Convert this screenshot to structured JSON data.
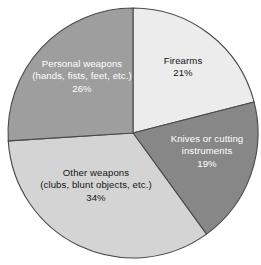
{
  "chart_data": {
    "type": "pie",
    "title": "",
    "subtitle": "",
    "xlabel": "",
    "ylabel": "",
    "legend_position": "none",
    "grid": false,
    "labels_inside_slices": true,
    "start_angle_deg": 0,
    "direction": "clockwise",
    "units": "%",
    "categories": [
      "Firearms",
      "Knives or cutting instruments",
      "Other weapons (clubs, blunt objects, etc.)",
      "Personal weapons (hands, fists, feet, etc.)"
    ],
    "values": [
      21,
      19,
      34,
      26
    ],
    "slices": [
      {
        "id": "firearms",
        "label_lines": [
          "Firearms"
        ],
        "value": 21,
        "value_text": "21%",
        "color": "#ececec",
        "text_color": "#141414",
        "start_deg": 0,
        "end_deg": 75.6
      },
      {
        "id": "knives",
        "label_lines": [
          "Knives or cutting",
          "instruments"
        ],
        "value": 19,
        "value_text": "19%",
        "color": "#878787",
        "text_color": "#ffffff",
        "start_deg": 75.6,
        "end_deg": 144.0
      },
      {
        "id": "other-weapons",
        "label_lines": [
          "Other weapons",
          "(clubs, blunt objects, etc.)"
        ],
        "value": 34,
        "value_text": "34%",
        "color": "#d4d4d4",
        "text_color": "#141414",
        "start_deg": 144.0,
        "end_deg": 266.4
      },
      {
        "id": "personal-weapons",
        "label_lines": [
          "Personal weapons",
          "(hands, fists, feet, etc.)"
        ],
        "value": 26,
        "value_text": "26%",
        "color": "#9e9e9e",
        "text_color": "#ffffff",
        "start_deg": 266.4,
        "end_deg": 360.0
      }
    ],
    "geometry": {
      "center_x": 133,
      "center_y": 133,
      "radius": 125,
      "outline_color": "#4a4a4a"
    },
    "background_color": "#ffffff"
  },
  "labels": {
    "firearms": {
      "line1": "Firearms",
      "value": "21%"
    },
    "knives": {
      "line1": "Knives or cutting",
      "line2": "instruments",
      "value": "19%"
    },
    "other_weapons": {
      "line1": "Other weapons",
      "line2": "(clubs, blunt objects, etc.)",
      "value": "34%"
    },
    "personal_weapons": {
      "line1": "Personal weapons",
      "line2": "(hands, fists, feet, etc.)",
      "value": "26%"
    }
  }
}
